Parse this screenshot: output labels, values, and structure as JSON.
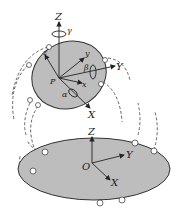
{
  "diagram": {
    "type": "parallel-manipulator",
    "colors": {
      "platform_fill": "#bdbdbd",
      "outline": "#333333",
      "axis": "#222222",
      "leg_dash": "#555555",
      "joint_fill": "#ffffff"
    },
    "moving_platform": {
      "origin_label": "P",
      "global_axes": {
        "z": "Z",
        "y": "Y",
        "x": "X"
      },
      "local_axes": {
        "z": "z",
        "y": "y",
        "x": "x"
      },
      "rotations": {
        "about_z": "γ",
        "about_y": "β",
        "about_x": "α"
      }
    },
    "base_platform": {
      "origin_label": "O",
      "axes": {
        "z": "Z",
        "y": "Y",
        "x": "X"
      }
    }
  }
}
